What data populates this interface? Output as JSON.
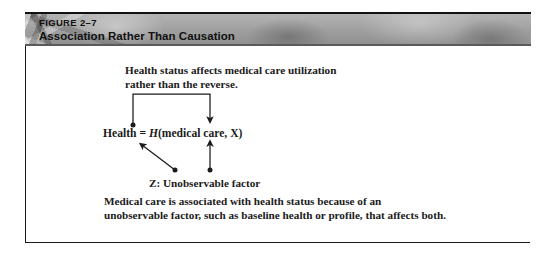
{
  "figure": {
    "number": "FIGURE 2–7",
    "title": "Association Rather Than Causation"
  },
  "diagram": {
    "top_caption": "Health status affects medical care utilization\nrather than the reverse.",
    "equation_lhs": "Health = ",
    "equation_func": "H",
    "equation_args": "(medical care, X)",
    "z_label": "Z: Unobservable factor",
    "bottom_caption": "Medical care is associated with health status because of an\nunobservable factor, such as baseline health or profile, that affects both."
  },
  "colors": {
    "ink": "#1b1b1b",
    "frame": "#1a1a1a",
    "header_band": "#a6a6a6",
    "header_text": "#111111"
  }
}
